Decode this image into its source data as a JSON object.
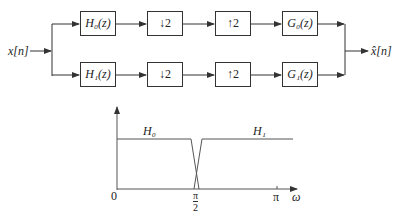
{
  "diagram": {
    "input_label": "x[n]",
    "output_label": "x̂[n]",
    "upper_branch": {
      "analysis_filter": "H₀(z)",
      "downsampler": "↓2",
      "upsampler": "↑2",
      "synthesis_filter": "G₀(z)"
    },
    "lower_branch": {
      "analysis_filter": "H₁(z)",
      "downsampler": "↓2",
      "upsampler": "↑2",
      "synthesis_filter": "G₁(z)"
    }
  },
  "plot": {
    "curve_labels": {
      "h0": "H₀",
      "h1": "H₁"
    },
    "x_axis_label": "ω",
    "ticks": {
      "origin": "0",
      "half_pi_num": "π",
      "half_pi_den": "2",
      "pi": "π"
    }
  }
}
